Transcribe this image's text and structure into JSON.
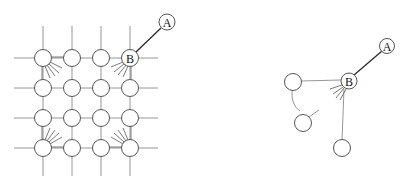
{
  "figure": {
    "left_panel": {
      "description": "4x4 lattice of nodes with external node A attached to node B",
      "grid": {
        "columns_x": [
          43,
          72,
          101,
          130
        ],
        "rows_y": [
          58,
          88,
          118,
          148
        ],
        "node_radius": 8.5
      },
      "labels": {
        "node_a": "A",
        "node_b": "B"
      },
      "node_a": {
        "x": 167,
        "y": 22,
        "r": 8
      },
      "node_b": {
        "x": 130,
        "y": 58
      }
    },
    "right_panel": {
      "description": "Reduced graph: node B connected to A and three other nodes",
      "labels": {
        "node_a": "A",
        "node_b": "B"
      },
      "node_a": {
        "x": 387,
        "y": 46,
        "r": 7
      },
      "node_b": {
        "x": 349,
        "y": 81,
        "r": 8
      },
      "others": [
        {
          "x": 293,
          "y": 82,
          "r": 8.5
        },
        {
          "x": 303,
          "y": 123,
          "r": 8.5
        },
        {
          "x": 342,
          "y": 148,
          "r": 8.5
        }
      ]
    },
    "colors": {
      "background": "#ffffff",
      "node_stroke": "#555555",
      "edge": "#8a8a8a",
      "strong_edge": "#2a2a2a"
    }
  }
}
